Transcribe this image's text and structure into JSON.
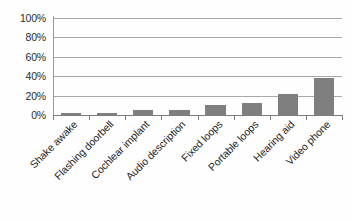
{
  "chart_data": {
    "type": "bar",
    "title": "",
    "subtitle": "",
    "xlabel": "",
    "ylabel": "",
    "ylim": [
      0,
      100
    ],
    "y_unit": "%",
    "grid": true,
    "legend": false,
    "legend_position": "none",
    "orientation": "vertical",
    "bar_color": "#7f7f7f",
    "gridline_color": "#a8a8a8",
    "axis_color": "#7d7d7d",
    "background_color": "#ffffff",
    "y_ticks": [
      "0%",
      "20%",
      "40%",
      "60%",
      "80%",
      "100%"
    ],
    "y_tick_values": [
      0,
      20,
      40,
      60,
      80,
      100
    ],
    "categories": [
      "Shake awake",
      "Flashing doorbell",
      "Cochlear implant",
      "Audio description",
      "Fixed loops",
      "Portable loops",
      "Hearing aid",
      "Video phone"
    ],
    "values": [
      2,
      2,
      5,
      5,
      10,
      12,
      22,
      38
    ],
    "series": [
      {
        "name": "Percentage",
        "values": [
          2,
          2,
          5,
          5,
          10,
          12,
          22,
          38
        ]
      }
    ],
    "annotations": []
  }
}
